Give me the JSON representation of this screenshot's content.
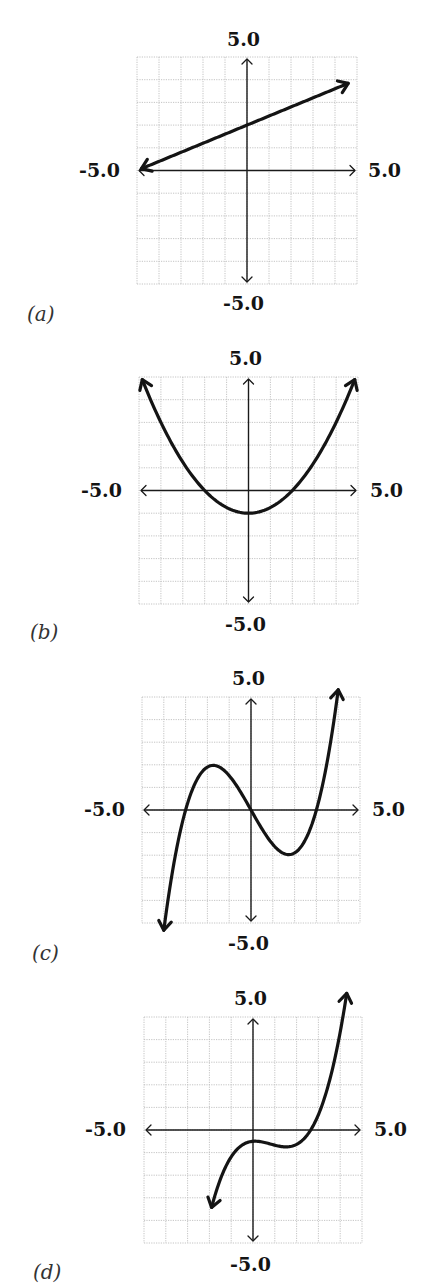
{
  "chart_data": [
    {
      "type": "line",
      "panel": "(a)",
      "title": "",
      "xlabel": "",
      "ylabel": "",
      "xlim": [
        -5,
        5
      ],
      "ylim": [
        -5,
        5
      ],
      "grid": true,
      "tick_labels": {
        "top": "5.0",
        "bottom": "-5.0",
        "left": "-5.0",
        "right": "5.0"
      },
      "function": "linear",
      "description": "y = 0.4x + 2",
      "points": [
        [
          -4.8,
          0.08
        ],
        [
          -3,
          0.8
        ],
        [
          0,
          2.0
        ],
        [
          2,
          2.8
        ],
        [
          4.6,
          3.84
        ]
      ],
      "arrows": "both ends"
    },
    {
      "type": "line",
      "panel": "(b)",
      "title": "",
      "xlabel": "",
      "ylabel": "",
      "xlim": [
        -5,
        5
      ],
      "ylim": [
        -5,
        5
      ],
      "grid": true,
      "tick_labels": {
        "top": "5.0",
        "bottom": "-5.0",
        "left": "-5.0",
        "right": "5.0"
      },
      "function": "quadratic",
      "description": "y = 0.25x^2 - 1",
      "points": [
        [
          -4.8,
          4.76
        ],
        [
          -4,
          3
        ],
        [
          -2,
          0
        ],
        [
          0,
          -1
        ],
        [
          2,
          0
        ],
        [
          4,
          3
        ],
        [
          4.8,
          4.76
        ]
      ],
      "arrows": "both ends"
    },
    {
      "type": "line",
      "panel": "(c)",
      "title": "",
      "xlabel": "",
      "ylabel": "",
      "xlim": [
        -5,
        5
      ],
      "ylim": [
        -5,
        5
      ],
      "grid": true,
      "tick_labels": {
        "top": "5.0",
        "bottom": "-5.0",
        "left": "-5.0",
        "right": "5.0"
      },
      "function": "cubic",
      "description": "y = 0.19x^3 - 1.7x (roots at -3, 0, 3)",
      "points": [
        [
          -4,
          -5.0
        ],
        [
          -3,
          0
        ],
        [
          -1.7,
          1.95
        ],
        [
          0,
          0
        ],
        [
          1.7,
          -1.95
        ],
        [
          3,
          0
        ],
        [
          4,
          5.0
        ]
      ],
      "arrows": "both ends"
    },
    {
      "type": "line",
      "panel": "(d)",
      "title": "",
      "xlabel": "",
      "ylabel": "",
      "xlim": [
        -5,
        5
      ],
      "ylim": [
        -5,
        5
      ],
      "grid": true,
      "tick_labels": {
        "top": "5.0",
        "bottom": "-5.0",
        "left": "-5.0",
        "right": "5.0"
      },
      "function": "cubic",
      "description": "local max near (0, -0.5), local min near (2, -0.85), root near x = 2.9",
      "points": [
        [
          -1.9,
          -4.6
        ],
        [
          -1,
          -1.6
        ],
        [
          0,
          -0.5
        ],
        [
          1,
          -0.7
        ],
        [
          2,
          -0.85
        ],
        [
          2.9,
          0
        ],
        [
          4.3,
          4.6
        ]
      ],
      "arrows": "both ends"
    }
  ],
  "panels": [
    {
      "label": "(a)",
      "top_tick": "5.0",
      "bottom_tick": "-5.0",
      "left_tick": "-5.0",
      "right_tick": "5.0",
      "grid": {
        "x0": 137,
        "y0": 57,
        "x1": 357,
        "y1": 284
      },
      "curve": {
        "kind": "poly",
        "coeffs": [
          2,
          0.4,
          0,
          0
        ],
        "xmin": -4.8,
        "xmax": 4.6
      }
    },
    {
      "label": "(b)",
      "top_tick": "5.0",
      "bottom_tick": "-5.0",
      "left_tick": "-5.0",
      "right_tick": "5.0",
      "grid": {
        "x0": 139,
        "y0": 377,
        "x1": 358,
        "y1": 604
      },
      "curve": {
        "kind": "poly",
        "coeffs": [
          -1,
          0,
          0.25,
          0
        ],
        "xmin": -4.85,
        "xmax": 4.85
      }
    },
    {
      "label": "(c)",
      "top_tick": "5.0",
      "bottom_tick": "-5.0",
      "left_tick": "-5.0",
      "right_tick": "5.0",
      "grid": {
        "x0": 142,
        "y0": 697,
        "x1": 360,
        "y1": 923
      },
      "curve": {
        "kind": "poly",
        "coeffs": [
          0,
          -1.71,
          0,
          0.19
        ],
        "xmin": -4.0,
        "xmax": 4.0
      }
    },
    {
      "label": "(d)",
      "top_tick": "5.0",
      "bottom_tick": "-5.0",
      "left_tick": "-5.0",
      "right_tick": "5.0",
      "grid": {
        "x0": 144,
        "y0": 1017,
        "x1": 362,
        "y1": 1243
      },
      "curve": {
        "kind": "poly",
        "coeffs": [
          -0.5,
          0.08,
          -0.43,
          0.178
        ],
        "xmin": -1.9,
        "xmax": 4.3
      }
    }
  ],
  "colors": {
    "curve": "#141414",
    "axis": "#1a1a1a",
    "grid": "#bdbdbd",
    "background": "#ffffff"
  }
}
